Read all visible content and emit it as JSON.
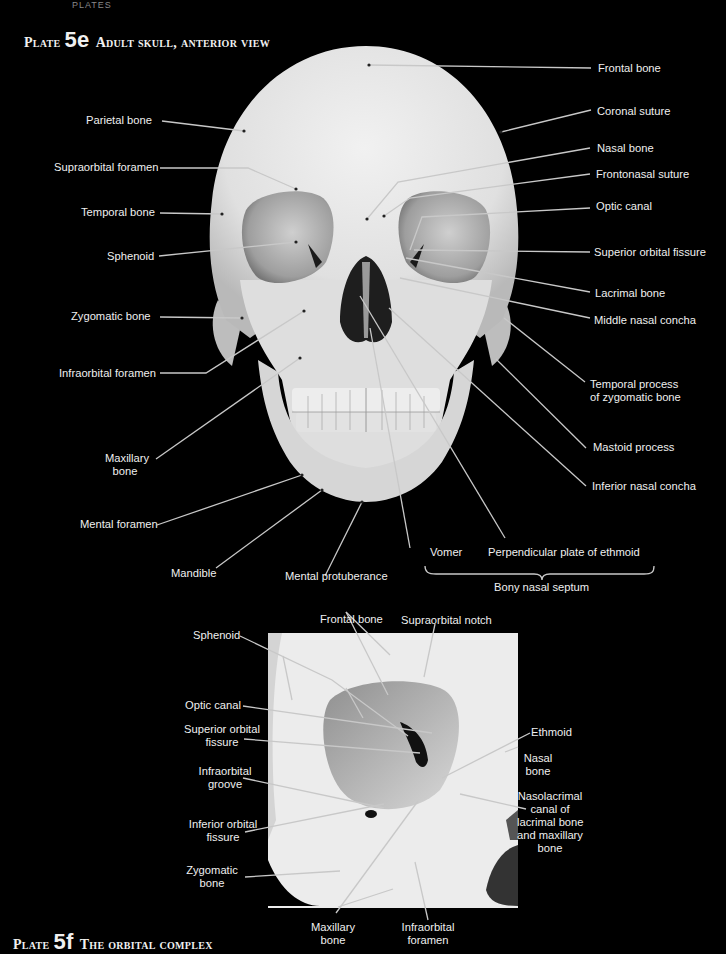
{
  "header_fragment": "PLATES",
  "plate_5e": {
    "prefix": "Plate",
    "number": "5e",
    "title": "Adult skull, anterior view",
    "labels_left": [
      {
        "text": "Parietal bone"
      },
      {
        "text": "Supraorbital foramen"
      },
      {
        "text": "Temporal bone"
      },
      {
        "text": "Sphenoid"
      },
      {
        "text": "Zygomatic bone"
      },
      {
        "text": "Infraorbital foramen"
      },
      {
        "text": "Maxillary bone",
        "line1": "Maxillary",
        "line2": "bone"
      },
      {
        "text": "Mental foramen"
      },
      {
        "text": "Mandible"
      },
      {
        "text": "Mental protuberance"
      }
    ],
    "labels_right": [
      {
        "text": "Frontal bone"
      },
      {
        "text": "Coronal suture"
      },
      {
        "text": "Nasal bone"
      },
      {
        "text": "Frontonasal suture"
      },
      {
        "text": "Optic canal"
      },
      {
        "text": "Superior orbital fissure"
      },
      {
        "text": "Lacrimal bone"
      },
      {
        "text": "Middle nasal concha"
      },
      {
        "text": "Temporal process of zygomatic bone",
        "line1": "Temporal process",
        "line2": "of zygomatic bone"
      },
      {
        "text": "Mastoid process"
      },
      {
        "text": "Inferior nasal concha"
      }
    ],
    "septum": {
      "vomer": "Vomer",
      "perpendicular_plate": "Perpendicular plate of ethmoid",
      "group_label": "Bony nasal septum"
    }
  },
  "plate_5f": {
    "prefix": "Plate",
    "number": "5f",
    "title": "The orbital complex",
    "labels": [
      {
        "text": "Sphenoid"
      },
      {
        "text": "Frontal bone"
      },
      {
        "text": "Supraorbital notch"
      },
      {
        "text": "Optic canal"
      },
      {
        "text": "Superior orbital fissure",
        "line1": "Superior orbital",
        "line2": "fissure"
      },
      {
        "text": "Infraorbital groove",
        "line1": "Infraorbital",
        "line2": "groove"
      },
      {
        "text": "Inferior orbital fissure",
        "line1": "Inferior orbital",
        "line2": "fissure"
      },
      {
        "text": "Zygomatic bone",
        "line1": "Zygomatic",
        "line2": "bone"
      },
      {
        "text": "Maxillary bone",
        "line1": "Maxillary",
        "line2": "bone"
      },
      {
        "text": "Infraorbital foramen",
        "line1": "Infraorbital",
        "line2": "foramen"
      },
      {
        "text": "Ethmoid"
      },
      {
        "text": "Nasal bone",
        "line1": "Nasal",
        "line2": "bone"
      },
      {
        "text": "Nasolacrimal canal of lacrimal bone and maxillary bone",
        "line1": "Nasolacrimal",
        "line2": "canal of",
        "line3": "lacrimal bone",
        "line4": "and maxillary",
        "line5": "bone"
      }
    ]
  },
  "colors": {
    "background": "#000000",
    "bone": "#e6e6e6",
    "bone_shadow": "#bdbdbd",
    "orbit_shadow": "#8a8a8a",
    "text": "#efefef",
    "leader": "#c8c8c8"
  }
}
